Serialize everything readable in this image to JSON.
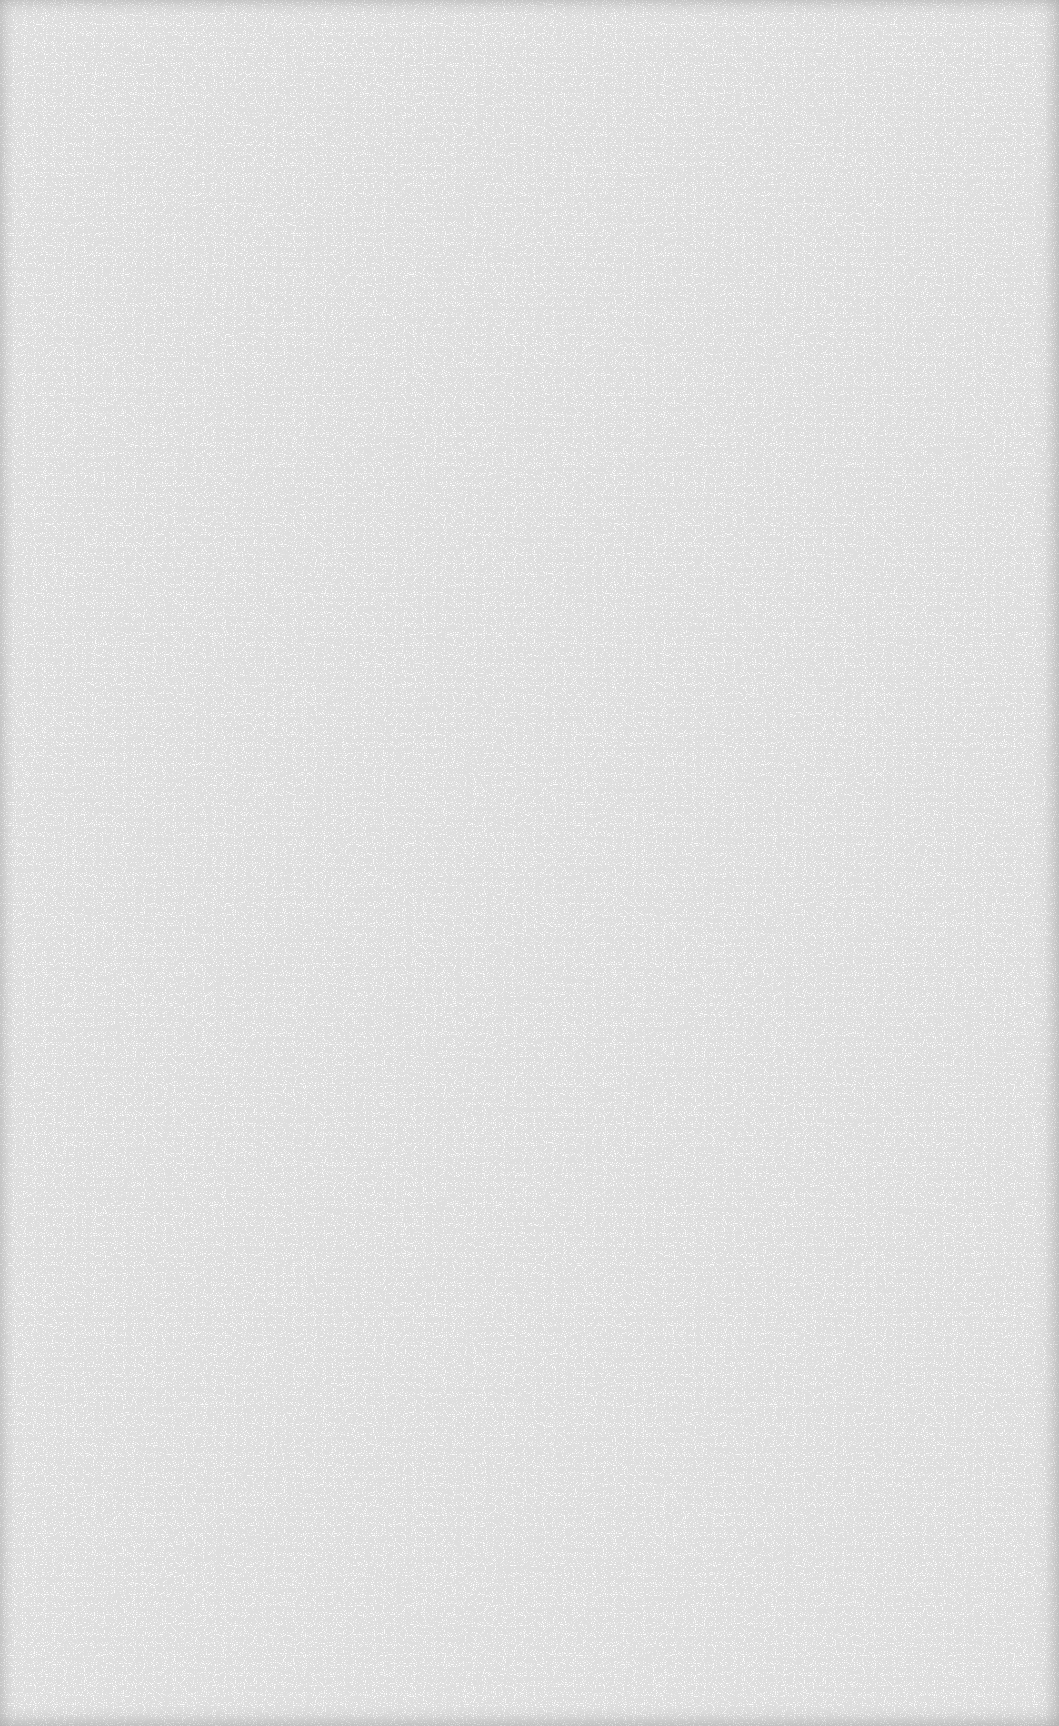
{
  "page": {
    "type": "blank-scanned-page",
    "background_color": "#fefefe",
    "edge_shade_color": "#969696",
    "text_blocks": []
  }
}
